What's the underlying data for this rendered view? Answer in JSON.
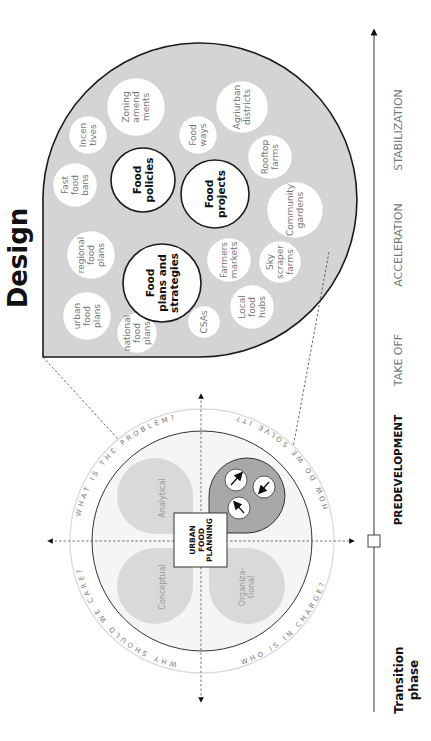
{
  "title": "Design",
  "design_bubbles": {
    "major": [
      {
        "label_lines": [
          "Food",
          "policies"
        ]
      },
      {
        "label_lines": [
          "Food",
          "projects"
        ]
      },
      {
        "label_lines": [
          "Food",
          "plans and",
          "strategies"
        ]
      }
    ],
    "minor": [
      {
        "label_lines": [
          "Zoning",
          "amend",
          "ments"
        ]
      },
      {
        "label_lines": [
          "Incen",
          "tives"
        ]
      },
      {
        "label_lines": [
          "Fast",
          "food",
          "bans"
        ]
      },
      {
        "label_lines": [
          "regional",
          "food",
          "plans"
        ]
      },
      {
        "label_lines": [
          "urban",
          "food",
          "plans"
        ]
      },
      {
        "label_lines": [
          "national",
          "food",
          "plans"
        ]
      },
      {
        "label_lines": [
          "CSAs"
        ]
      },
      {
        "label_lines": [
          "Local",
          "food",
          "hubs"
        ]
      },
      {
        "label_lines": [
          "Farmers",
          "markets"
        ]
      },
      {
        "label_lines": [
          "Sky",
          "scraper",
          "farms"
        ]
      },
      {
        "label_lines": [
          "Community",
          "gardens"
        ]
      },
      {
        "label_lines": [
          "Rooftop",
          "farms"
        ]
      },
      {
        "label_lines": [
          "Food",
          "ways"
        ]
      },
      {
        "label_lines": [
          "Agriurban",
          "districts"
        ]
      }
    ]
  },
  "framework": {
    "center_lines": [
      "URBAN",
      "FOOD",
      "PLANNING"
    ],
    "quadrants": [
      {
        "label": "Analytical"
      },
      {
        "label": "Conceptual"
      },
      {
        "label_lines": [
          "Organiza-",
          "tional"
        ]
      }
    ],
    "ring_questions": [
      "WHAT IS THE PROBLEM?",
      "HOW DO WE SOLVE IT?",
      "WHO IS IN CHARGE?",
      "WHY SHOULD WE CARE?"
    ]
  },
  "timeline": {
    "heading_lines": [
      "Transition",
      "phase"
    ],
    "phases": [
      {
        "label": "PREDEVELOPMENT",
        "active": true
      },
      {
        "label": "TAKE OFF",
        "active": false
      },
      {
        "label": "ACCELERATION",
        "active": false
      },
      {
        "label": "STABILIZATION",
        "active": false
      }
    ]
  },
  "colors": {
    "shape_fill": "#d4d4d4",
    "bubble_fill": "#ffffff",
    "outline": "#1a1a1a",
    "quadrant_fill": "#d9d9d9",
    "design_quadrant_fill": "#a8a8a8",
    "ring_light": "#dcdcdc",
    "inner_bg": "#f4f4f4"
  }
}
